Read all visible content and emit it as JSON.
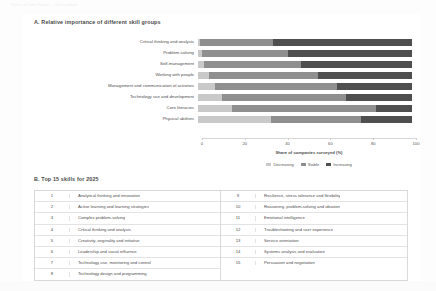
{
  "document": {
    "header_strip": "Future of Jobs Report — skills outlook",
    "panel_a_title": "A. Relative importance of different skill groups",
    "panel_b_title": "B. Top 15 skills for 2025"
  },
  "chart_data": {
    "type": "bar",
    "title": "A. Relative importance of different skill groups",
    "xlabel": "Share of companies surveyed (%)",
    "ylabel": "",
    "xlim": [
      0,
      100
    ],
    "xticks": [
      "0",
      "20",
      "40",
      "60",
      "80",
      "100"
    ],
    "grid": false,
    "legend_position": "bottom",
    "stacked": true,
    "orientation": "horizontal",
    "categories": [
      "Critical thinking and analysis",
      "Problem-solving",
      "Self-management",
      "Working with people",
      "Management and communication of activities",
      "Technology use and development",
      "Core literacies",
      "Physical abilities"
    ],
    "series": [
      {
        "name": "Decreasing",
        "color": "#c9c9c9",
        "values": [
          1,
          2,
          3,
          5,
          8,
          11,
          16,
          34
        ]
      },
      {
        "name": "Stable",
        "color": "#8f8f8f",
        "values": [
          34,
          40,
          45,
          51,
          57,
          58,
          67,
          42
        ]
      },
      {
        "name": "Increasing",
        "color": "#4f4f4f",
        "values": [
          65,
          58,
          52,
          44,
          35,
          31,
          17,
          24
        ]
      }
    ]
  },
  "axis": {
    "ticks": [
      {
        "label": "0",
        "value": 0
      },
      {
        "label": "20",
        "value": 20
      },
      {
        "label": "40",
        "value": 40
      },
      {
        "label": "60",
        "value": 60
      },
      {
        "label": "80",
        "value": 80
      },
      {
        "label": "100",
        "value": 100
      }
    ],
    "title": "Share of companies surveyed (%)"
  },
  "legend": {
    "items": [
      {
        "label": "Decreasing"
      },
      {
        "label": "Stable"
      },
      {
        "label": "Increasing"
      }
    ]
  },
  "skills_table": {
    "left": [
      {
        "rank": "1",
        "skill": "Analytical thinking and innovation"
      },
      {
        "rank": "2",
        "skill": "Active learning and learning strategies"
      },
      {
        "rank": "3",
        "skill": "Complex problem-solving"
      },
      {
        "rank": "4",
        "skill": "Critical thinking and analysis"
      },
      {
        "rank": "5",
        "skill": "Creativity, originality and initiative"
      },
      {
        "rank": "6",
        "skill": "Leadership and social influence"
      },
      {
        "rank": "7",
        "skill": "Technology use, monitoring and control"
      },
      {
        "rank": "8",
        "skill": "Technology design and programming"
      }
    ],
    "right": [
      {
        "rank": "9",
        "skill": "Resilience, stress tolerance and flexibility"
      },
      {
        "rank": "10",
        "skill": "Reasoning, problem-solving and ideation"
      },
      {
        "rank": "11",
        "skill": "Emotional intelligence"
      },
      {
        "rank": "12",
        "skill": "Troubleshooting and user experience"
      },
      {
        "rank": "13",
        "skill": "Service orientation"
      },
      {
        "rank": "14",
        "skill": "Systems analysis and evaluation"
      },
      {
        "rank": "15",
        "skill": "Persuasion and negotiation"
      }
    ]
  }
}
